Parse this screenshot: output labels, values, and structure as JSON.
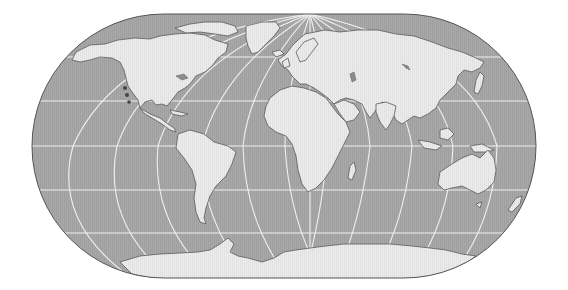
{
  "map": {
    "title": "World map (oblique rounded pseudo-cylindrical projection)",
    "projection": "oblique Eckert-style with rounded sides, pole converging at top center",
    "colors": {
      "background": "#ffffff",
      "ocean": "#a6a6a6",
      "land": "#ececec",
      "graticule": "#f2f2f2",
      "outline": "#555555",
      "coast": "#5a5a5a",
      "lakes": "#8c8c8c"
    },
    "frame": {
      "left": 32,
      "right": 536,
      "top": 14,
      "bottom": 278,
      "corner_radius": 132
    },
    "graticule": {
      "parallels_y": [
        57,
        101,
        146,
        190,
        233
      ],
      "meridian_equator_x": [
        73,
        117,
        158,
        202,
        243,
        285,
        328,
        370,
        412,
        453,
        497
      ],
      "convergence_point": [
        310,
        14
      ]
    },
    "landmasses": [
      "North America",
      "Greenland",
      "South America",
      "Europe",
      "Africa",
      "Asia",
      "Madagascar",
      "Australia",
      "New Zealand",
      "Antarctica",
      "Japan",
      "Indonesia",
      "Arctic islands"
    ]
  }
}
